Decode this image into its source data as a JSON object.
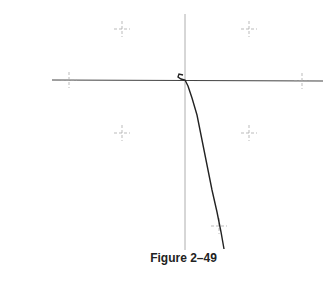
{
  "figure": {
    "caption": "Figure 2–49"
  },
  "chart_data": {
    "type": "line",
    "title": "",
    "xlabel": "",
    "ylabel": "",
    "axes": {
      "origin_px": [
        185,
        80
      ],
      "horizontal_axis_px": [
        52,
        323
      ],
      "vertical_axis_px": [
        14,
        250
      ]
    },
    "grid_markers_px": [
      [
        122,
        29
      ],
      [
        249,
        29
      ],
      [
        69,
        80
      ],
      [
        302,
        81
      ],
      [
        122,
        133
      ],
      [
        249,
        133
      ],
      [
        219,
        226
      ]
    ],
    "curve_px": [
      [
        183,
        75
      ],
      [
        179,
        74
      ],
      [
        178,
        77
      ],
      [
        181,
        79
      ],
      [
        185,
        80
      ],
      [
        188,
        86
      ],
      [
        192,
        98
      ],
      [
        197,
        115
      ],
      [
        202,
        140
      ],
      [
        207,
        165
      ],
      [
        212,
        190
      ],
      [
        217,
        212
      ],
      [
        221,
        232
      ],
      [
        224,
        249
      ]
    ],
    "colors": {
      "curve": "#222222",
      "axis": "#888888",
      "horizontal_axis": "#444444",
      "marker": "#aaaaaa"
    }
  }
}
